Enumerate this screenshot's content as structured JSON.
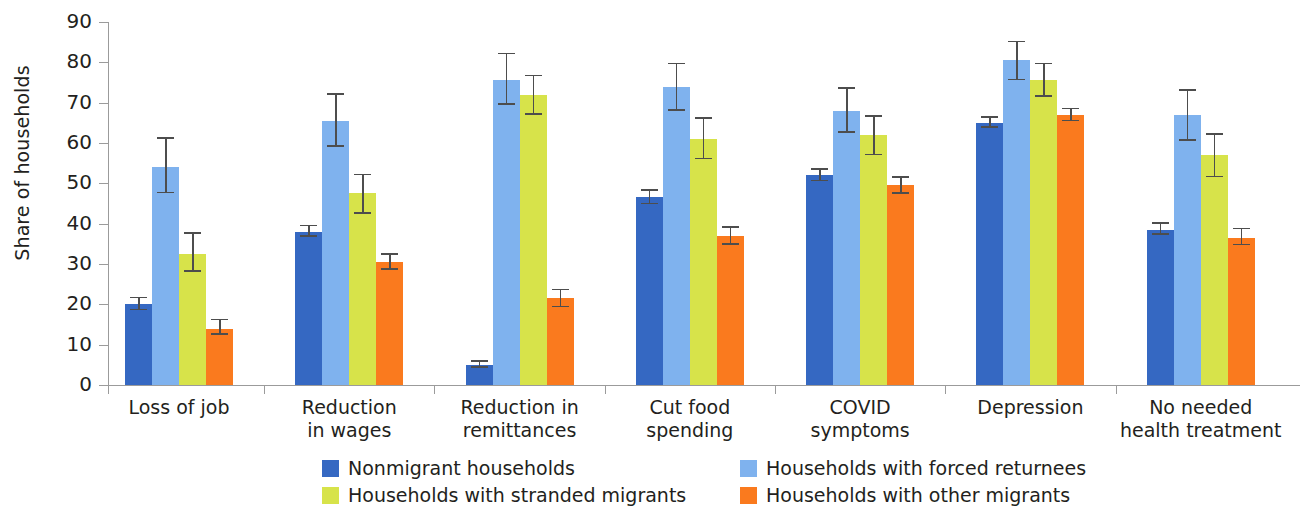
{
  "chart_data": {
    "type": "bar",
    "title": "",
    "subtitle": "",
    "xlabel": "",
    "ylabel": "Share of households",
    "ylim": [
      0,
      90
    ],
    "ytick_step": 10,
    "yticks": [
      0,
      10,
      20,
      30,
      40,
      50,
      60,
      70,
      80,
      90
    ],
    "grid": false,
    "legend_position": "bottom",
    "error_bars": "95% confidence interval",
    "categories": [
      "Loss of job",
      "Reduction in wages",
      "Reduction in remittances",
      "Cut food spending",
      "COVID symptoms",
      "Depression",
      "No needed health treatment"
    ],
    "category_lines": [
      [
        "Loss of job"
      ],
      [
        "Reduction",
        "in wages"
      ],
      [
        "Reduction in",
        "remittances"
      ],
      [
        "Cut food",
        "spending"
      ],
      [
        "COVID",
        "symptoms"
      ],
      [
        "Depression"
      ],
      [
        "No needed",
        "health treatment"
      ]
    ],
    "series": [
      {
        "name": "Nonmigrant households",
        "color": "#3568C2",
        "values": [
          20.0,
          38.0,
          5.0,
          46.5,
          52.0,
          65.0,
          38.5
        ],
        "err_low": [
          18.5,
          36.8,
          4.2,
          44.8,
          50.5,
          63.8,
          37.2
        ],
        "err_high": [
          21.5,
          39.4,
          5.8,
          48.1,
          53.4,
          66.3,
          40.0
        ]
      },
      {
        "name": "Households with forced returnees",
        "color": "#7FB2EE",
        "values": [
          54.0,
          65.5,
          75.5,
          74.0,
          68.0,
          80.5,
          67.0
        ],
        "err_low": [
          47.5,
          59.0,
          69.5,
          68.0,
          62.5,
          75.5,
          60.5
        ],
        "err_high": [
          61.0,
          72.0,
          82.0,
          79.5,
          73.5,
          85.0,
          73.0
        ]
      },
      {
        "name": "Households with stranded migrants",
        "color": "#D7E34A",
        "values": [
          32.5,
          47.5,
          72.0,
          61.0,
          62.0,
          75.5,
          57.0
        ],
        "err_low": [
          28.0,
          42.5,
          67.0,
          56.0,
          57.0,
          71.5,
          51.5
        ],
        "err_high": [
          37.5,
          52.0,
          76.5,
          66.0,
          66.5,
          79.5,
          62.0
        ]
      },
      {
        "name": "Households with other migrants",
        "color": "#FA7A1E",
        "values": [
          14.0,
          30.5,
          21.5,
          37.0,
          49.5,
          67.0,
          36.5
        ],
        "err_low": [
          12.4,
          28.6,
          19.3,
          34.8,
          47.4,
          65.4,
          34.6
        ],
        "err_high": [
          16.0,
          32.3,
          23.5,
          39.0,
          51.4,
          68.4,
          38.6
        ]
      }
    ]
  },
  "legend": {
    "items": [
      {
        "label": "Nonmigrant households",
        "color": "#3568C2"
      },
      {
        "label": "Households with forced returnees",
        "color": "#7FB2EE"
      },
      {
        "label": "Households with stranded migrants",
        "color": "#D7E34A"
      },
      {
        "label": "Households with other migrants",
        "color": "#FA7A1E"
      }
    ]
  },
  "axis": {
    "y_title": "Share of households"
  }
}
